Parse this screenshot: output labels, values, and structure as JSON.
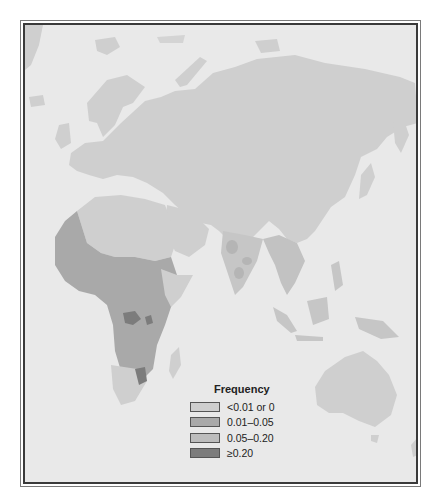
{
  "map": {
    "region": "Eastern Hemisphere (Europe, Africa, Asia, Oceania)",
    "background_color": "#e9e9e9",
    "regions": [
      {
        "name": "Northern Eurasia",
        "class": "<0.01 or 0"
      },
      {
        "name": "Europe",
        "class": "<0.01 or 0"
      },
      {
        "name": "North Africa / Sahara",
        "class": "<0.01 or 0"
      },
      {
        "name": "Arabian Peninsula",
        "class": "<0.01 or 0"
      },
      {
        "name": "West Africa",
        "class": "0.01–0.05"
      },
      {
        "name": "Central & Southern Africa",
        "class": "0.01–0.05"
      },
      {
        "name": "East African Great Lakes",
        "class": "≥0.20"
      },
      {
        "name": "Southeast Africa (Mozambique/Swaziland area)",
        "class": "≥0.20"
      },
      {
        "name": "South Africa (Cape)",
        "class": "<0.01 or 0"
      },
      {
        "name": "India (central spots)",
        "class": "0.05–0.20"
      },
      {
        "name": "Southeast Asia",
        "class": "0.01–0.05"
      },
      {
        "name": "Australia",
        "class": "<0.01 or 0"
      }
    ]
  },
  "legend": {
    "title": "Frequency",
    "items": [
      {
        "label": "<0.01 or 0",
        "color": "#cfcfcf"
      },
      {
        "label": "0.01–0.05",
        "color": "#a9a9a9"
      },
      {
        "label": "0.05–0.20",
        "color": "#bdbdbd"
      },
      {
        "label": "≥0.20",
        "color": "#7c7c7c"
      }
    ]
  }
}
